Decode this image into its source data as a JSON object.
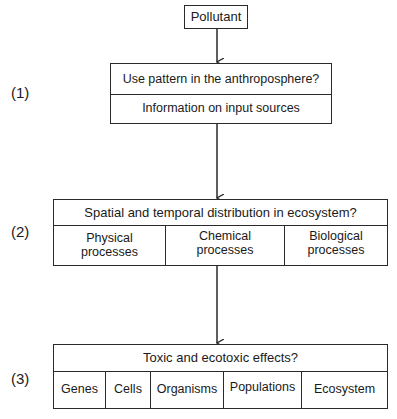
{
  "diagram": {
    "start": {
      "label": "Pollutant"
    },
    "stages": [
      {
        "number": "(1)",
        "question": "Use pattern in the anthroposphere?",
        "items": [
          "Information on input sources"
        ]
      },
      {
        "number": "(2)",
        "question": "Spatial and temporal distribution in ecosystem?",
        "items": [
          "Physical processes",
          "Chemical processes",
          "Biological processes"
        ]
      },
      {
        "number": "(3)",
        "question": "Toxic and ecotoxic effects?",
        "items": [
          "Genes",
          "Cells",
          "Organisms",
          "Populations",
          "Ecosystem"
        ]
      }
    ],
    "line_color": "#2a2a2a"
  }
}
